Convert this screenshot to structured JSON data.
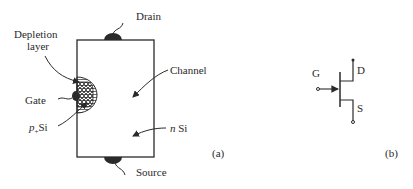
{
  "figure_a": {
    "label": "(a)",
    "labels": {
      "drain": "Drain",
      "source": "Source",
      "depletion_line1": "Depletion",
      "depletion_line2": "layer",
      "gate": "Gate",
      "p_si_italic": "p",
      "p_si_sub": "+",
      "p_si_rest": "Si",
      "channel": "Channel",
      "n_si_italic": "n",
      "n_si_rest": " Si"
    }
  },
  "figure_b": {
    "label": "(b)",
    "terminals": {
      "gate": "G",
      "drain": "D",
      "source": "S"
    }
  },
  "colors": {
    "ink": "#2a2a2a",
    "background": "#ffffff"
  }
}
